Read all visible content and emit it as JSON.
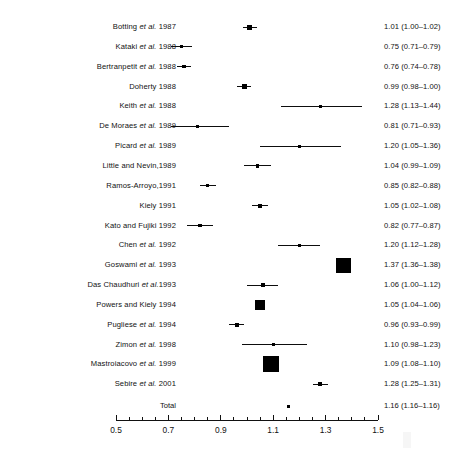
{
  "chart_data": {
    "type": "forest",
    "title": "",
    "xlabel": "",
    "ylabel": "",
    "xlim": [
      0.5,
      1.5
    ],
    "grid": false,
    "legend": "none",
    "axis": {
      "tick_labels": [
        "0.5",
        "0.7",
        "0.9",
        "1.1",
        "1.3",
        "1.5"
      ],
      "tick_values": [
        0.5,
        0.7,
        0.9,
        1.1,
        1.3,
        1.5
      ],
      "minor_tick_step": 0.05,
      "left_px": 116,
      "right_px": 378
    },
    "columns": [
      "Study",
      "Estimate (95% CI)"
    ],
    "studies": [
      {
        "label": "Botting et al. 1987",
        "label_italic": "et al.",
        "estimate": 1.01,
        "ci_low": 1.0,
        "ci_high": 1.02,
        "text": "1.01 (1.00–1.02)",
        "marker_size": 5
      },
      {
        "label": "Kataki et al. 1988",
        "label_italic": "et al.",
        "estimate": 0.75,
        "ci_low": 0.71,
        "ci_high": 0.79,
        "text": "0.75 (0.71–0.79)",
        "marker_size": 3.2
      },
      {
        "label": "Bertranpetit et al. 1988",
        "label_italic": "et al.",
        "estimate": 0.76,
        "ci_low": 0.74,
        "ci_high": 0.78,
        "text": "0.76 (0.74–0.78)",
        "marker_size": 3.6
      },
      {
        "label": "Doherty 1988",
        "label_italic": "",
        "estimate": 0.99,
        "ci_low": 0.98,
        "ci_high": 1.0,
        "text": "0.99 (0.98–1.00)",
        "marker_size": 5.4
      },
      {
        "label": "Keith et al. 1988",
        "label_italic": "et al.",
        "estimate": 1.28,
        "ci_low": 1.13,
        "ci_high": 1.44,
        "text": "1.28 (1.13–1.44)",
        "marker_size": 2.8
      },
      {
        "label": "De Moraes et al. 1989",
        "label_italic": "et al.",
        "estimate": 0.81,
        "ci_low": 0.71,
        "ci_high": 0.93,
        "text": "0.81 (0.71–0.93)",
        "marker_size": 3.0
      },
      {
        "label": "Picard et al. 1989",
        "label_italic": "et al.",
        "estimate": 1.2,
        "ci_low": 1.05,
        "ci_high": 1.36,
        "text": "1.20 (1.05–1.36)",
        "marker_size": 3.0
      },
      {
        "label": "Little and Nevin,1989",
        "label_italic": "",
        "estimate": 1.04,
        "ci_low": 0.99,
        "ci_high": 1.09,
        "text": "1.04 (0.99–1.09)",
        "marker_size": 3.4
      },
      {
        "label": "Ramos-Arroyo,1991",
        "label_italic": "",
        "estimate": 0.85,
        "ci_low": 0.82,
        "ci_high": 0.88,
        "text": "0.85 (0.82–0.88)",
        "marker_size": 3.4
      },
      {
        "label": "Kiely 1991",
        "label_italic": "",
        "estimate": 1.05,
        "ci_low": 1.02,
        "ci_high": 1.08,
        "text": "1.05 (1.02–1.08)",
        "marker_size": 3.8
      },
      {
        "label": "Kato and Fujiki 1992",
        "label_italic": "",
        "estimate": 0.82,
        "ci_low": 0.77,
        "ci_high": 0.87,
        "text": "0.82 (0.77–0.87)",
        "marker_size": 3.4
      },
      {
        "label": "Chen et al. 1992",
        "label_italic": "et al.",
        "estimate": 1.2,
        "ci_low": 1.12,
        "ci_high": 1.28,
        "text": "1.20 (1.12–1.28)",
        "marker_size": 3.4
      },
      {
        "label": "Goswami et al. 1993",
        "label_italic": "et al.",
        "estimate": 1.37,
        "ci_low": 1.36,
        "ci_high": 1.38,
        "text": "1.37 (1.36–1.38)",
        "marker_size": 15
      },
      {
        "label": "Das Chaudhuri et al.1993",
        "label_italic": "et al.",
        "estimate": 1.06,
        "ci_low": 1.0,
        "ci_high": 1.12,
        "text": "1.06 (1.00–1.12)",
        "marker_size": 3.8
      },
      {
        "label": "Powers and Kiely 1994",
        "label_italic": "",
        "estimate": 1.05,
        "ci_low": 1.04,
        "ci_high": 1.06,
        "text": "1.05 (1.04–1.06)",
        "marker_size": 9.5
      },
      {
        "label": "Pugliese et al. 1994",
        "label_italic": "et al.",
        "estimate": 0.96,
        "ci_low": 0.93,
        "ci_high": 0.99,
        "text": "0.96 (0.93–0.99)",
        "marker_size": 4.0
      },
      {
        "label": "Zimon et al. 1998",
        "label_italic": "et al.",
        "estimate": 1.1,
        "ci_low": 0.98,
        "ci_high": 1.23,
        "text": "1.10 (0.98–1.23)",
        "marker_size": 3.0
      },
      {
        "label": "Mastroiacovo et al. 1999",
        "label_italic": "et al.",
        "estimate": 1.09,
        "ci_low": 1.08,
        "ci_high": 1.1,
        "text": "1.09 (1.08–1.10)",
        "marker_size": 16
      },
      {
        "label": "Sebire et al. 2001",
        "label_italic": "et al.",
        "estimate": 1.28,
        "ci_low": 1.25,
        "ci_high": 1.31,
        "text": "1.28 (1.25–1.31)",
        "marker_size": 4.0
      }
    ],
    "total": {
      "label": "Total",
      "estimate": 1.16,
      "ci_low": 1.16,
      "ci_high": 1.16,
      "text": "1.16 (1.16–1.16)",
      "marker_size": 3.0
    }
  },
  "style": {
    "marker_color": "#000000",
    "line_color": "#0d0d0d",
    "axis_color": "#111111",
    "background": "#ffffff"
  }
}
